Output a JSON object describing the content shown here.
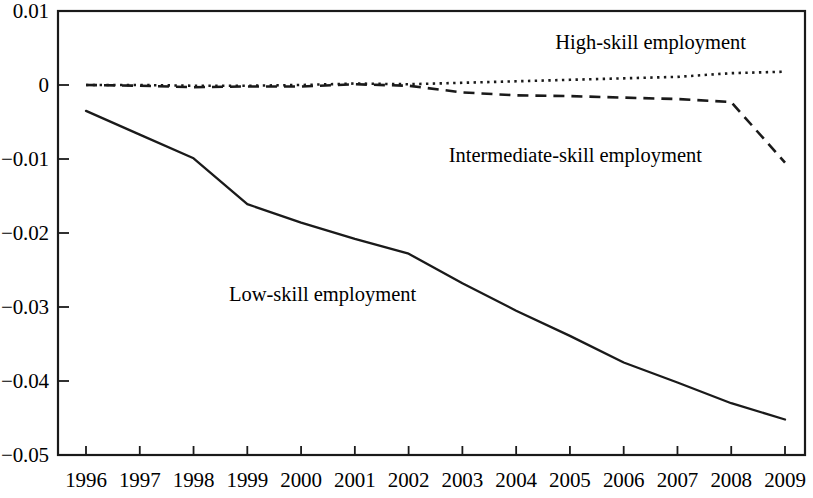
{
  "chart_data": {
    "type": "line",
    "title": "",
    "subtitle": "",
    "xlabel": "",
    "ylabel": "",
    "xlim": [
      1996,
      2009
    ],
    "ylim": [
      -0.05,
      0.01
    ],
    "grid": false,
    "legend_position": "inline-annotations",
    "x": [
      1996,
      1997,
      1998,
      1999,
      2000,
      2001,
      2002,
      2003,
      2004,
      2005,
      2006,
      2007,
      2008,
      2009
    ],
    "xtick_labels": [
      "1996",
      "1997",
      "1998",
      "1999",
      "2000",
      "2001",
      "2002",
      "2003",
      "2004",
      "2005",
      "2006",
      "2007",
      "2008",
      "2009"
    ],
    "ytick_values": [
      0.01,
      0,
      -0.01,
      -0.02,
      -0.03,
      -0.04,
      -0.05
    ],
    "ytick_labels": [
      "0.01",
      "0",
      "−0.01",
      "−0.02",
      "−0.03",
      "−0.04",
      "−0.05"
    ],
    "series": [
      {
        "name": "High-skill employment",
        "style": "dotted",
        "color": "#1a1a1a",
        "values": [
          0.0,
          0.0,
          -0.0001,
          -0.0001,
          0.0,
          0.0002,
          0.0001,
          0.0003,
          0.0005,
          0.0007,
          0.0009,
          0.0011,
          0.0016,
          0.0018
        ]
      },
      {
        "name": "Intermediate-skill employment",
        "style": "dashed",
        "color": "#1a1a1a",
        "values": [
          0.0,
          -0.0001,
          -0.0003,
          -0.0002,
          -0.0002,
          0.0001,
          -0.0001,
          -0.001,
          -0.0014,
          -0.0015,
          -0.0017,
          -0.0019,
          -0.0023,
          -0.0105
        ]
      },
      {
        "name": "Low-skill employment",
        "style": "solid",
        "color": "#1a1a1a",
        "values": [
          -0.0035,
          -0.0067,
          -0.0099,
          -0.0161,
          -0.0186,
          -0.0208,
          -0.0228,
          -0.0268,
          -0.0305,
          -0.0339,
          -0.0375,
          -0.0402,
          -0.043,
          -0.0452
        ]
      }
    ],
    "annotations": [
      {
        "text": "High-skill employment",
        "x": 2006.5,
        "y": 0.0055
      },
      {
        "text": "Intermediate-skill employment",
        "x": 2005.1,
        "y": -0.0097
      },
      {
        "text": "Low-skill employment",
        "x": 2000.4,
        "y": -0.0285
      }
    ]
  }
}
